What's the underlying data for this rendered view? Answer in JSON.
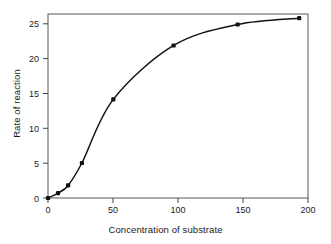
{
  "chart_data": {
    "type": "line",
    "title": "",
    "xlabel": "Concentration of substrate",
    "ylabel": "Rate of reaction",
    "xlim": [
      0,
      207
    ],
    "ylim": [
      0,
      26.3
    ],
    "grid": false,
    "legend": null,
    "xticks": [
      0,
      50,
      100,
      150,
      200
    ],
    "xticklabels": [
      "0",
      "50",
      "100",
      "150",
      "200"
    ],
    "yticks": [
      0,
      5,
      10,
      15,
      20,
      25
    ],
    "yticklabels": [
      "0",
      "5",
      "10",
      "15",
      "20",
      "25"
    ],
    "series": [
      {
        "name": "Rate of reaction",
        "color": "#111111",
        "marker": "filled-square",
        "x": [
          0,
          8,
          16,
          27,
          52,
          100,
          151,
          200
        ],
        "y": [
          0,
          0.7,
          1.8,
          5.0,
          14.1,
          21.8,
          24.8,
          25.7
        ]
      }
    ]
  },
  "axis": {
    "x_title": "Concentration of substrate",
    "y_title": "Rate of reaction"
  },
  "style": {
    "line_color": "#111111",
    "marker_color": "#111111",
    "frame_color": "#555555",
    "background": "#ffffff"
  }
}
